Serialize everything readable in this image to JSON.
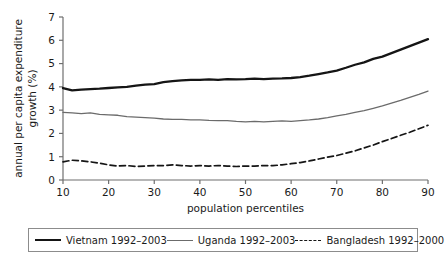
{
  "chart_data": {
    "type": "line",
    "title": "",
    "xlabel": "population percentiles",
    "ylabel": "annual per capita expenditure growth (%)",
    "xlim": [
      10,
      90
    ],
    "ylim": [
      0,
      7
    ],
    "xticks": [
      10,
      20,
      30,
      40,
      50,
      60,
      70,
      80,
      90
    ],
    "yticks": [
      0,
      1,
      2,
      3,
      4,
      5,
      6,
      7
    ],
    "grid": false,
    "legend_position": "below-axes",
    "x": [
      10,
      12,
      14,
      16,
      18,
      20,
      22,
      24,
      26,
      28,
      30,
      32,
      34,
      36,
      38,
      40,
      42,
      44,
      46,
      48,
      50,
      52,
      54,
      56,
      58,
      60,
      62,
      64,
      66,
      68,
      70,
      72,
      74,
      76,
      78,
      80,
      82,
      84,
      86,
      88,
      90
    ],
    "series": [
      {
        "name": "Vietnam 1992-2003",
        "style": "solid-thick",
        "color": "#151515",
        "width": 2.3,
        "values": [
          3.95,
          3.85,
          3.88,
          3.9,
          3.92,
          3.95,
          3.98,
          4.0,
          4.05,
          4.1,
          4.12,
          4.2,
          4.25,
          4.28,
          4.3,
          4.3,
          4.32,
          4.3,
          4.33,
          4.32,
          4.33,
          4.35,
          4.33,
          4.35,
          4.36,
          4.38,
          4.42,
          4.48,
          4.55,
          4.62,
          4.7,
          4.82,
          4.95,
          5.05,
          5.2,
          5.3,
          5.45,
          5.6,
          5.75,
          5.9,
          6.05
        ]
      },
      {
        "name": "Uganda 1992-2003",
        "style": "solid-thin",
        "color": "#6b6b6b",
        "width": 1.3,
        "values": [
          2.9,
          2.88,
          2.85,
          2.88,
          2.82,
          2.8,
          2.78,
          2.72,
          2.7,
          2.68,
          2.66,
          2.62,
          2.6,
          2.6,
          2.58,
          2.58,
          2.56,
          2.55,
          2.55,
          2.52,
          2.5,
          2.52,
          2.5,
          2.52,
          2.54,
          2.52,
          2.55,
          2.58,
          2.62,
          2.68,
          2.75,
          2.82,
          2.9,
          2.98,
          3.08,
          3.18,
          3.3,
          3.42,
          3.55,
          3.68,
          3.82
        ]
      },
      {
        "name": "Bangladesh 1992-2000",
        "style": "dashed",
        "color": "#151515",
        "width": 1.7,
        "values": [
          0.78,
          0.85,
          0.82,
          0.78,
          0.72,
          0.65,
          0.6,
          0.62,
          0.58,
          0.6,
          0.62,
          0.62,
          0.65,
          0.62,
          0.6,
          0.62,
          0.6,
          0.62,
          0.6,
          0.58,
          0.6,
          0.6,
          0.62,
          0.62,
          0.65,
          0.7,
          0.75,
          0.82,
          0.9,
          0.98,
          1.05,
          1.15,
          1.25,
          1.38,
          1.5,
          1.65,
          1.78,
          1.92,
          2.05,
          2.2,
          2.35
        ]
      }
    ]
  },
  "legend": {
    "entries": [
      {
        "label": "Vietnam 1992–2003",
        "style": "solid-thick",
        "color": "#151515"
      },
      {
        "label": "Uganda 1992–2003",
        "style": "solid-thin",
        "color": "#6b6b6b"
      },
      {
        "label": "Bangladesh 1992–2000",
        "style": "dashed",
        "color": "#151515"
      }
    ]
  },
  "caption": {
    "partial_text": ""
  }
}
